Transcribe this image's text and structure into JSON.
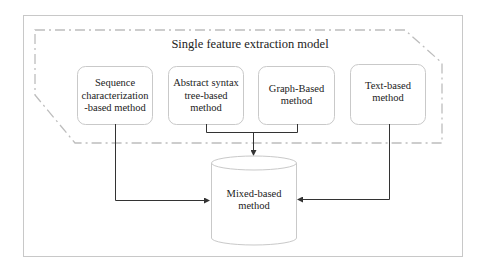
{
  "diagram": {
    "group_title": "Single feature extraction model",
    "methods": [
      {
        "label": "Sequence characterization -based method",
        "lines": [
          "Sequence",
          "characterization",
          "-based method"
        ]
      },
      {
        "label": "Abstract syntax tree-based method",
        "lines": [
          "Abstract syntax",
          "tree-based",
          "method"
        ]
      },
      {
        "label": "Graph-Based method",
        "lines": [
          "Graph-Based",
          "method"
        ]
      },
      {
        "label": "Text-based method",
        "lines": [
          "Text-based",
          "method"
        ]
      }
    ],
    "target": {
      "label": "Mixed-based method",
      "lines": [
        "Mixed-based",
        "method"
      ]
    },
    "colors": {
      "frame": "#c8c8c8",
      "dashdot": "#bdbdbd",
      "box_border": "#c9c9c9",
      "arrow": "#333333"
    }
  }
}
